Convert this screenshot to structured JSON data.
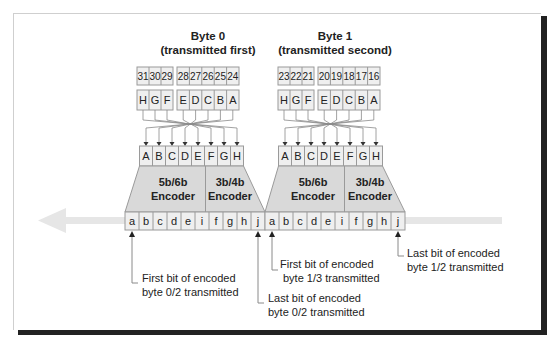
{
  "bytes": [
    {
      "title": "Byte 0",
      "subtitle": "(transmitted first)",
      "bit_numbers": [
        "31",
        "30",
        "29",
        "28",
        "27",
        "26",
        "25",
        "24"
      ],
      "input_letters": [
        "H",
        "G",
        "F",
        "E",
        "D",
        "C",
        "B",
        "A"
      ],
      "reordered_letters": [
        "A",
        "B",
        "C",
        "D",
        "E",
        "F",
        "G",
        "H"
      ],
      "encoder_5b6b": [
        "5b/6b",
        "Encoder"
      ],
      "encoder_3b4b": [
        "3b/4b",
        "Encoder"
      ],
      "encoded_bits": [
        "a",
        "b",
        "c",
        "d",
        "e",
        "i",
        "f",
        "g",
        "h",
        "j"
      ]
    },
    {
      "title": "Byte 1",
      "subtitle": "(transmitted second)",
      "bit_numbers": [
        "23",
        "22",
        "21",
        "20",
        "19",
        "18",
        "17",
        "16"
      ],
      "input_letters": [
        "H",
        "G",
        "F",
        "E",
        "D",
        "C",
        "B",
        "A"
      ],
      "reordered_letters": [
        "A",
        "B",
        "C",
        "D",
        "E",
        "F",
        "G",
        "H"
      ],
      "encoder_5b6b": [
        "5b/6b",
        "Encoder"
      ],
      "encoder_3b4b": [
        "3b/4b",
        "Encoder"
      ],
      "encoded_bits": [
        "a",
        "b",
        "c",
        "d",
        "e",
        "i",
        "f",
        "g",
        "h",
        "j"
      ]
    }
  ],
  "annotations": [
    {
      "line1": "First bit of encoded",
      "line2": "byte 0/2 transmitted"
    },
    {
      "line1": "Last bit of encoded",
      "line2": "byte 0/2 transmitted"
    },
    {
      "line1": "First bit of encoded",
      "line2": "byte 1/3 transmitted"
    },
    {
      "line1": "Last bit of encoded",
      "line2": "byte 1/2 transmitted"
    }
  ],
  "colors": {
    "cell_fill": "#efefef",
    "cell_stroke": "#9a9a9a",
    "encoder_fill": "#d9d9d9",
    "arrow_band": "#e4e4e4",
    "text": "#222222"
  }
}
